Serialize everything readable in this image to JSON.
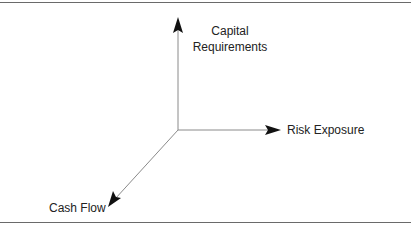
{
  "diagram": {
    "type": "3d-axes",
    "axes": [
      {
        "id": "vertical",
        "label_lines": [
          "Capital",
          "Requirements"
        ],
        "direction": "up"
      },
      {
        "id": "horizontal",
        "label": "Risk Exposure",
        "direction": "right"
      },
      {
        "id": "diagonal",
        "label": "Cash Flow",
        "direction": "down-left"
      }
    ]
  },
  "colors": {
    "line": "#8a8a8a",
    "arrowhead": "#111111",
    "rule": "#6a6a6a",
    "text": "#222222"
  }
}
